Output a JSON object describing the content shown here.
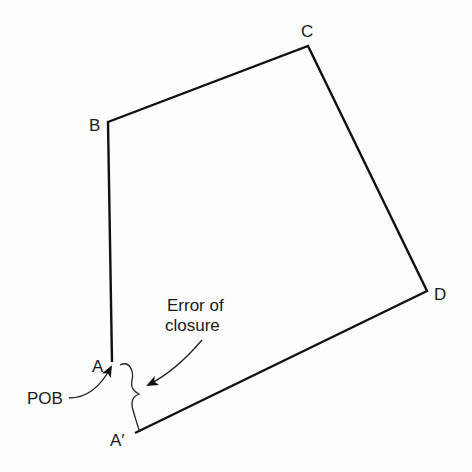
{
  "diagram": {
    "stroke_color": "#111111",
    "vertices": {
      "A": {
        "label": "A",
        "x": 112,
        "y": 362
      },
      "B": {
        "label": "B",
        "x": 108,
        "y": 122
      },
      "C": {
        "label": "C",
        "x": 308,
        "y": 46
      },
      "D": {
        "label": "D",
        "x": 427,
        "y": 291
      },
      "A_prime": {
        "label": "A′",
        "x": 135,
        "y": 433
      }
    },
    "annotations": {
      "error_line1": "Error of",
      "error_line2": "closure",
      "pob": "POB"
    }
  }
}
